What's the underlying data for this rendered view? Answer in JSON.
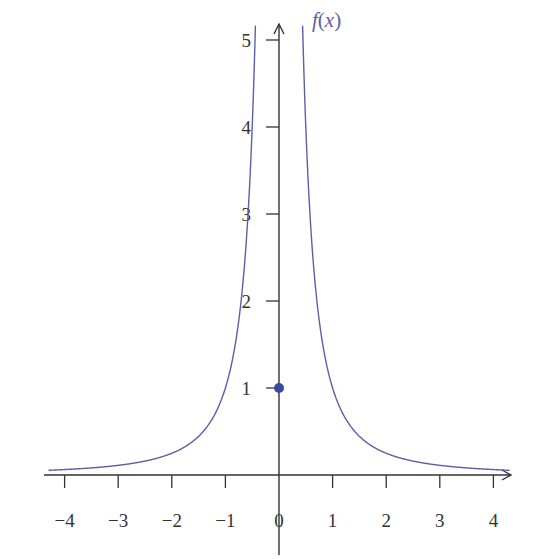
{
  "chart_data": {
    "type": "line",
    "title": "",
    "xlabel": "",
    "ylabel": "f(x)",
    "function": "f(x) = 1/x^2 for x != 0, f(0) = 1",
    "xlim": [
      -4.3,
      4.3
    ],
    "ylim": [
      0,
      5.2
    ],
    "grid": false,
    "legend": null,
    "x_ticks": [
      -4,
      -3,
      -2,
      -1,
      0,
      1,
      2,
      3,
      4
    ],
    "x_tick_labels": [
      "−4",
      "−3",
      "−2",
      "−1",
      "0",
      "1",
      "2",
      "3",
      "4"
    ],
    "y_ticks": [
      1,
      2,
      3,
      4,
      5
    ],
    "y_tick_labels": [
      "1",
      "2",
      "3",
      "4",
      "5"
    ],
    "series": [
      {
        "name": "f(x)",
        "color": "#5a5fa8",
        "x": [
          -4.3,
          -4,
          -3,
          -2,
          -1.5,
          -1,
          -0.75,
          -0.707,
          -0.577,
          -0.5,
          -0.447,
          -0.44
        ],
        "y": [
          0.054,
          0.0625,
          0.111,
          0.25,
          0.444,
          1,
          1.778,
          2,
          3,
          4,
          5,
          5.17
        ]
      },
      {
        "name": "f(x) right branch",
        "color": "#5a5fa8",
        "x": [
          0.44,
          0.447,
          0.5,
          0.577,
          0.707,
          0.75,
          1,
          1.5,
          2,
          3,
          4,
          4.3
        ],
        "y": [
          5.17,
          5,
          4,
          3,
          2,
          1.778,
          1,
          0.444,
          0.25,
          0.111,
          0.0625,
          0.054
        ]
      }
    ],
    "points": [
      {
        "label": "isolated point",
        "x": 0,
        "y": 1,
        "color": "#3a4a9a",
        "filled": true
      }
    ],
    "annotations": [
      {
        "text": "f(x)",
        "position": "top of y-axis, right side"
      }
    ]
  },
  "labels": {
    "fn_f": "f",
    "fn_paren_open": "(",
    "fn_x": "x",
    "fn_paren_close": ")"
  }
}
